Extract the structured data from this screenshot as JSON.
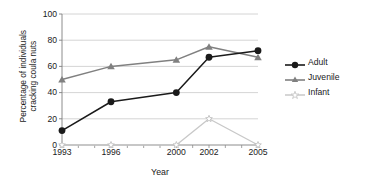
{
  "chart_data": {
    "type": "line",
    "title": "",
    "xlabel": "Year",
    "ylabel": "Percentage of individuals\ncracking coula nuts",
    "x": [
      1993,
      1996,
      2000,
      2002,
      2005
    ],
    "xtick_labels": [
      "1993",
      "1996",
      "2000",
      "2002",
      "2005"
    ],
    "ytick_labels": [
      "0",
      "20",
      "40",
      "60",
      "80",
      "100"
    ],
    "ytick_values": [
      0,
      20,
      40,
      60,
      80,
      100
    ],
    "xlim": [
      1993,
      2005
    ],
    "ylim": [
      0,
      100
    ],
    "grid": "horizontal",
    "legend_position": "right",
    "series": [
      {
        "name": "Adult",
        "values": [
          11,
          33,
          40,
          67,
          72
        ],
        "color": "#1a1a1a",
        "marker": "filled-circle"
      },
      {
        "name": "Juvenile",
        "values": [
          50,
          60,
          65,
          75,
          67
        ],
        "color": "#808080",
        "marker": "filled-triangle"
      },
      {
        "name": "Infant",
        "values": [
          0,
          0,
          0,
          20,
          0
        ],
        "color": "#c8c8c8",
        "marker": "open-star"
      }
    ]
  },
  "legend": {
    "entries": [
      {
        "label": "Adult"
      },
      {
        "label": "Juvenile"
      },
      {
        "label": "Infant"
      }
    ]
  },
  "axes": {
    "x_title": "Year",
    "y_title": "Percentage of individuals\ncracking coula nuts"
  }
}
